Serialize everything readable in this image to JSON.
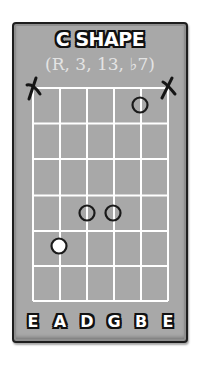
{
  "title": "C SHAPE",
  "subtitle": "(R, 3, 13, ♭7)",
  "colors": {
    "card_background": "#a8a8a8",
    "border": "#1e1e1e",
    "grid_lines": "#ffffff",
    "marker_outline": "#1a1a1a",
    "root_fill": "#ffffff"
  },
  "fretboard": {
    "strings": [
      "E",
      "A",
      "D",
      "G",
      "B",
      "E"
    ],
    "string_count": 6,
    "fret_rows": 6,
    "muted_strings": [
      {
        "string": 1,
        "label": "E",
        "symbol": "X"
      },
      {
        "string": 6,
        "label": "E",
        "symbol": "X"
      }
    ],
    "markers": [
      {
        "string": 5,
        "string_label": "B",
        "fret": 1,
        "type": "open-circle",
        "interval": "3"
      },
      {
        "string": 3,
        "string_label": "D",
        "fret": 4,
        "type": "open-circle",
        "interval": "♭7"
      },
      {
        "string": 4,
        "string_label": "G",
        "fret": 4,
        "type": "open-circle",
        "interval": "13"
      },
      {
        "string": 2,
        "string_label": "A",
        "fret": 5,
        "type": "root-filled",
        "interval": "R"
      }
    ]
  },
  "string_labels": {
    "s1": "E",
    "s2": "A",
    "s3": "D",
    "s4": "G",
    "s5": "B",
    "s6": "E"
  },
  "mute_symbol": "X"
}
